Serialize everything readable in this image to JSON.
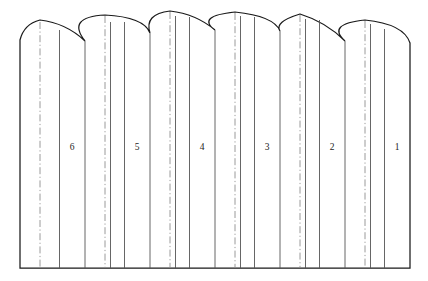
{
  "drawing": {
    "title": "Scalloped Fence Panel Elevation",
    "canvas": {
      "width": 428,
      "height": 281
    },
    "colors": {
      "background": "#ffffff",
      "outline": "#1a1a1a",
      "seam_line": "#555555",
      "center_line": "#8e8e8e",
      "label_text": "#232323"
    },
    "geometry": {
      "left_edge_x": 20,
      "right_edge_x": 410,
      "baseline_y": 268,
      "shoulder_y": 44,
      "peak_y": 16,
      "valley_y": 44,
      "section_count": 6,
      "section_width": 65
    },
    "line_styles": {
      "outline": "solid",
      "seam": "solid",
      "center": "dash-dot"
    }
  },
  "sections": [
    {
      "id": "section-6",
      "label": "6",
      "label_x": 72,
      "label_y": 148,
      "left_x": 20,
      "right_x": 85
    },
    {
      "id": "section-5",
      "label": "5",
      "label_x": 137,
      "label_y": 148,
      "left_x": 85,
      "right_x": 150
    },
    {
      "id": "section-4",
      "label": "4",
      "label_x": 202,
      "label_y": 148,
      "left_x": 150,
      "right_x": 215
    },
    {
      "id": "section-3",
      "label": "3",
      "label_x": 267,
      "label_y": 148,
      "left_x": 215,
      "right_x": 280
    },
    {
      "id": "section-2",
      "label": "2",
      "label_x": 332,
      "label_y": 148,
      "left_x": 280,
      "right_x": 345
    },
    {
      "id": "section-1",
      "label": "1",
      "label_x": 397,
      "label_y": 148,
      "left_x": 345,
      "right_x": 410
    }
  ],
  "seam_lines": [
    {
      "id": "seam-1",
      "x": 59.5
    },
    {
      "id": "seam-2",
      "x": 85.0
    },
    {
      "id": "seam-3",
      "x": 110.5
    },
    {
      "id": "seam-4",
      "x": 124.5
    },
    {
      "id": "seam-5",
      "x": 150.0
    },
    {
      "id": "seam-6",
      "x": 175.5
    },
    {
      "id": "seam-7",
      "x": 189.5
    },
    {
      "id": "seam-8",
      "x": 215.0
    },
    {
      "id": "seam-9",
      "x": 240.5
    },
    {
      "id": "seam-10",
      "x": 254.5
    },
    {
      "id": "seam-11",
      "x": 280.0
    },
    {
      "id": "seam-12",
      "x": 305.5
    },
    {
      "id": "seam-13",
      "x": 319.5
    },
    {
      "id": "seam-14",
      "x": 345.0
    },
    {
      "id": "seam-15",
      "x": 370.5
    },
    {
      "id": "seam-16",
      "x": 384.5
    }
  ],
  "center_lines": [
    {
      "id": "center-6",
      "x": 40.0
    },
    {
      "id": "center-5",
      "x": 105.0
    },
    {
      "id": "center-4",
      "x": 170.0
    },
    {
      "id": "center-3",
      "x": 235.0
    },
    {
      "id": "center-2",
      "x": 300.0
    },
    {
      "id": "center-1",
      "x": 365.0
    }
  ],
  "top_profile": {
    "description": "Scalloped crown: six arched segments with peaks at section mid-lines and valleys at section joints",
    "peaks_x": [
      40,
      105,
      170,
      235,
      300,
      365
    ],
    "valleys_x": [
      20,
      85,
      150,
      215,
      280,
      345,
      410
    ],
    "peak_heights_y": [
      20,
      15,
      11,
      12,
      14,
      20
    ],
    "valley_heights_y": [
      40,
      41,
      33,
      30,
      31,
      41,
      43
    ]
  }
}
